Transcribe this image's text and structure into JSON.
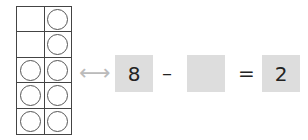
{
  "ten_frame": {
    "rows": 5,
    "cols": 2,
    "cells": [
      [
        false,
        true
      ],
      [
        false,
        true
      ],
      [
        true,
        true
      ],
      [
        true,
        true
      ],
      [
        true,
        true
      ]
    ],
    "filled_count": 8
  },
  "arrow": "⟷",
  "equation": {
    "minuend": "8",
    "minus": "–",
    "subtrahend": "",
    "equals": "=",
    "result": "2"
  }
}
